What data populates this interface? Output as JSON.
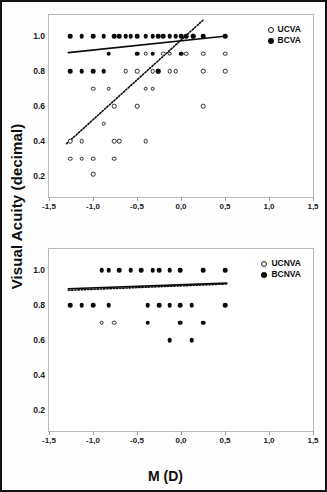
{
  "figure": {
    "ylabel": "Visual Acuity (decimal)",
    "xlabel": "M (D)",
    "frame_color": "#121212",
    "marker_color": "#0b0b0b"
  },
  "chart_data": [
    {
      "type": "scatter",
      "panel": "top",
      "title": "",
      "xlabel": "M (D)",
      "ylabel": "Visual Acuity (decimal)",
      "xlim": [
        -1.5,
        1.5
      ],
      "ylim": [
        0.08,
        1.12
      ],
      "grid": false,
      "legend_position": "top-right",
      "xticks": [
        "-1,5",
        "-1,0",
        "-0,5",
        "0,0",
        "0,5",
        "1,0",
        "1,5"
      ],
      "xtick_values": [
        -1.5,
        -1.0,
        -0.5,
        0.0,
        0.5,
        1.0,
        1.5
      ],
      "yticks": [
        "1.0",
        "0.8",
        "0.6",
        "0.4",
        "0.2"
      ],
      "ytick_values": [
        1.0,
        0.8,
        0.6,
        0.4,
        0.2
      ],
      "series": [
        {
          "name": "UCVA",
          "marker": "open-circle",
          "points": [
            [
              -1.26,
              0.4
            ],
            [
              -1.26,
              0.3
            ],
            [
              -1.13,
              0.4
            ],
            [
              -1.13,
              0.3
            ],
            [
              -1.0,
              0.7
            ],
            [
              -1.0,
              0.3
            ],
            [
              -1.0,
              0.21
            ],
            [
              -0.88,
              0.5
            ],
            [
              -0.82,
              0.7
            ],
            [
              -0.76,
              0.4
            ],
            [
              -0.76,
              0.6
            ],
            [
              -0.76,
              0.3
            ],
            [
              -0.7,
              0.4
            ],
            [
              -0.63,
              0.8
            ],
            [
              -0.5,
              0.8
            ],
            [
              -0.5,
              0.6
            ],
            [
              -0.4,
              0.9
            ],
            [
              -0.4,
              0.7
            ],
            [
              -0.4,
              0.4
            ],
            [
              -0.32,
              0.8
            ],
            [
              -0.32,
              0.7
            ],
            [
              -0.26,
              0.8
            ],
            [
              -0.2,
              0.9
            ],
            [
              -0.13,
              0.9
            ],
            [
              -0.13,
              0.8
            ],
            [
              -0.06,
              0.8
            ],
            [
              0.06,
              0.9
            ],
            [
              0.14,
              1.0
            ],
            [
              0.25,
              0.9
            ],
            [
              0.25,
              0.8
            ],
            [
              0.25,
              0.6
            ],
            [
              0.5,
              0.9
            ],
            [
              0.5,
              0.8
            ]
          ]
        },
        {
          "name": "BCVA",
          "marker": "filled-circle",
          "points": [
            [
              -1.26,
              1.0
            ],
            [
              -1.26,
              0.8
            ],
            [
              -1.13,
              1.0
            ],
            [
              -1.13,
              0.8
            ],
            [
              -1.0,
              1.0
            ],
            [
              -1.0,
              0.8
            ],
            [
              -0.88,
              1.0
            ],
            [
              -0.88,
              0.8
            ],
            [
              -0.82,
              0.9
            ],
            [
              -0.76,
              1.0
            ],
            [
              -0.7,
              1.0
            ],
            [
              -0.63,
              1.0
            ],
            [
              -0.57,
              1.0
            ],
            [
              -0.5,
              1.0
            ],
            [
              -0.5,
              0.9
            ],
            [
              -0.4,
              1.0
            ],
            [
              -0.32,
              1.0
            ],
            [
              -0.32,
              0.9
            ],
            [
              -0.26,
              1.0
            ],
            [
              -0.26,
              0.8
            ],
            [
              -0.2,
              1.0
            ],
            [
              -0.13,
              1.0
            ],
            [
              -0.06,
              1.0
            ],
            [
              0.0,
              1.0
            ],
            [
              0.0,
              0.9
            ],
            [
              0.06,
              1.0
            ],
            [
              0.14,
              1.0
            ],
            [
              0.25,
              1.0
            ],
            [
              0.5,
              1.0
            ]
          ]
        }
      ],
      "trendlines": [
        {
          "name": "BCVA-fit",
          "style": "solid",
          "x0": -1.28,
          "y0": 0.905,
          "x1": 0.52,
          "y1": 1.0
        },
        {
          "name": "UCVA-fit",
          "style": "dotted",
          "x0": -1.3,
          "y0": 0.385,
          "x1": 0.26,
          "y1": 1.095
        }
      ]
    },
    {
      "type": "scatter",
      "panel": "bottom",
      "title": "",
      "xlabel": "M (D)",
      "ylabel": "Visual Acuity (decimal)",
      "xlim": [
        -1.5,
        1.5
      ],
      "ylim": [
        0.08,
        1.12
      ],
      "grid": false,
      "legend_position": "top-right",
      "xticks": [
        "-1,5",
        "-1,0",
        "-0,5",
        "0,0",
        "0,5",
        "1,0",
        "1,5"
      ],
      "xtick_values": [
        -1.5,
        -1.0,
        -0.5,
        0.0,
        0.5,
        1.0,
        1.5
      ],
      "yticks": [
        "1.0",
        "0.8",
        "0.6",
        "0.4",
        "0.2"
      ],
      "ytick_values": [
        1.0,
        0.8,
        0.6,
        0.4,
        0.2
      ],
      "series": [
        {
          "name": "UCNVA",
          "marker": "open-circle",
          "points": [
            [
              -0.9,
              0.7
            ],
            [
              -0.76,
              0.7
            ]
          ]
        },
        {
          "name": "BCNVA",
          "marker": "filled-circle",
          "points": [
            [
              -1.26,
              0.8
            ],
            [
              -1.13,
              0.8
            ],
            [
              -1.0,
              0.8
            ],
            [
              -0.9,
              1.0
            ],
            [
              -0.82,
              1.0
            ],
            [
              -0.82,
              0.8
            ],
            [
              -0.7,
              1.0
            ],
            [
              -0.57,
              1.0
            ],
            [
              -0.45,
              1.0
            ],
            [
              -0.38,
              0.8
            ],
            [
              -0.38,
              0.7
            ],
            [
              -0.32,
              1.0
            ],
            [
              -0.25,
              1.0
            ],
            [
              -0.25,
              0.8
            ],
            [
              -0.13,
              1.0
            ],
            [
              -0.13,
              0.8
            ],
            [
              -0.13,
              0.6
            ],
            [
              -0.01,
              1.0
            ],
            [
              -0.01,
              0.8
            ],
            [
              -0.01,
              0.7
            ],
            [
              0.12,
              0.8
            ],
            [
              0.12,
              0.6
            ],
            [
              0.25,
              1.0
            ],
            [
              0.25,
              0.7
            ],
            [
              0.5,
              1.0
            ],
            [
              0.5,
              0.8
            ]
          ]
        }
      ],
      "trendlines": [
        {
          "name": "BCNVA-fit",
          "style": "solid",
          "x0": -1.28,
          "y0": 0.893,
          "x1": 0.52,
          "y1": 0.925
        },
        {
          "name": "UCNVA-fit",
          "style": "dotted",
          "x0": -1.28,
          "y0": 0.884,
          "x1": 0.52,
          "y1": 0.92
        }
      ]
    }
  ],
  "legends": {
    "top": [
      {
        "label": "UCVA",
        "marker": "open-circle"
      },
      {
        "label": "BCVA",
        "marker": "filled-circle"
      }
    ],
    "bottom": [
      {
        "label": "UCNVA",
        "marker": "open-circle"
      },
      {
        "label": "BCNVA",
        "marker": "filled-circle"
      }
    ]
  }
}
